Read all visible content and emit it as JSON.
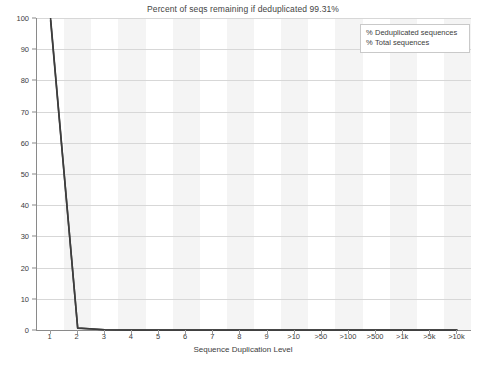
{
  "chart_data": {
    "type": "line",
    "title": "Percent of seqs remaining if deduplicated 99.31%",
    "xlabel": "Sequence Duplication Level",
    "ylabel": "",
    "categories": [
      "1",
      "2",
      "3",
      "4",
      "5",
      "6",
      "7",
      "8",
      "9",
      ">10",
      ">50",
      ">100",
      ">500",
      ">1k",
      ">5k",
      ">10k"
    ],
    "ylim": [
      0,
      100
    ],
    "yticks": [
      0,
      10,
      20,
      30,
      40,
      50,
      60,
      70,
      80,
      90,
      100
    ],
    "grid": true,
    "legend_position": "top-right",
    "series": [
      {
        "name": "% Deduplicated sequences",
        "color": "#3d3d3d",
        "values": [
          100.0,
          0.62,
          0.06,
          0.02,
          0.01,
          0.0,
          0.0,
          0.0,
          0.0,
          0.0,
          0.0,
          0.0,
          0.0,
          0.0,
          0.0,
          0.0
        ]
      },
      {
        "name": "% Total sequences",
        "color": "#3d3d3d",
        "values": [
          99.31,
          0.61,
          0.06,
          0.02,
          0.01,
          0.0,
          0.0,
          0.0,
          0.0,
          0.0,
          0.0,
          0.0,
          0.0,
          0.0,
          0.0,
          0.0
        ]
      }
    ]
  },
  "legend": {
    "items": [
      {
        "marker": "%",
        "label": "Deduplicated sequences"
      },
      {
        "marker": "%",
        "label": "Total sequences"
      }
    ]
  },
  "colors": {
    "line": "#3d3d3d",
    "axis": "#8a8a8a",
    "grid": "#d7d7d7",
    "band": "#f4f4f4",
    "background": "#ffffff",
    "text": "#3c3c3c"
  }
}
